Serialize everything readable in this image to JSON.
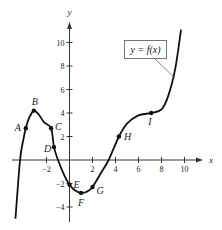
{
  "chart_data": {
    "type": "line",
    "title": "",
    "xlabel": "x",
    "ylabel": "y",
    "xlim": [
      -5,
      11.5
    ],
    "ylim": [
      -5,
      12
    ],
    "grid": false,
    "x_ticks": [
      -2,
      2,
      4,
      6,
      8,
      10
    ],
    "y_ticks": [
      -4,
      -2,
      2,
      4,
      6,
      8,
      10
    ],
    "legend": {
      "text": "y = f(x)",
      "position": "upper right"
    },
    "series": [
      {
        "name": "y = f(x)",
        "curve": [
          [
            -4.7,
            -5
          ],
          [
            -4.3,
            0
          ],
          [
            -4.0,
            1.8
          ],
          [
            -3.8,
            2.7
          ],
          [
            -3.5,
            3.6
          ],
          [
            -3.1,
            4.2
          ],
          [
            -2.7,
            3.9
          ],
          [
            -2.2,
            3.2
          ],
          [
            -1.6,
            2.7
          ],
          [
            -1.35,
            1.1
          ],
          [
            -1.0,
            0
          ],
          [
            -0.5,
            -1.2
          ],
          [
            0,
            -2.1
          ],
          [
            0.5,
            -2.6
          ],
          [
            1.0,
            -2.8
          ],
          [
            1.5,
            -2.7
          ],
          [
            2.0,
            -2.3
          ],
          [
            2.8,
            -1.0
          ],
          [
            3.4,
            0
          ],
          [
            4.3,
            2.0
          ],
          [
            5.0,
            3.1
          ],
          [
            6.0,
            3.8
          ],
          [
            7.1,
            4.0
          ],
          [
            8.0,
            4.3
          ],
          [
            8.6,
            5.5
          ],
          [
            9.2,
            7.8
          ],
          [
            9.7,
            11.1
          ]
        ]
      }
    ],
    "points": [
      {
        "label": "A",
        "x": -3.8,
        "y": 2.7
      },
      {
        "label": "B",
        "x": -3.1,
        "y": 4.2
      },
      {
        "label": "C",
        "x": -1.6,
        "y": 2.7
      },
      {
        "label": "D",
        "x": -1.35,
        "y": 1.1
      },
      {
        "label": "E",
        "x": 0,
        "y": -2.1
      },
      {
        "label": "F",
        "x": 1.0,
        "y": -2.8
      },
      {
        "label": "G",
        "x": 2.0,
        "y": -2.3
      },
      {
        "label": "H",
        "x": 4.3,
        "y": 2.0
      },
      {
        "label": "I",
        "x": 7.1,
        "y": 4.0
      }
    ]
  },
  "colors": {
    "curve": "#111111",
    "axis": "#333333",
    "legend_border": "#555555",
    "background": "#ffffff"
  }
}
